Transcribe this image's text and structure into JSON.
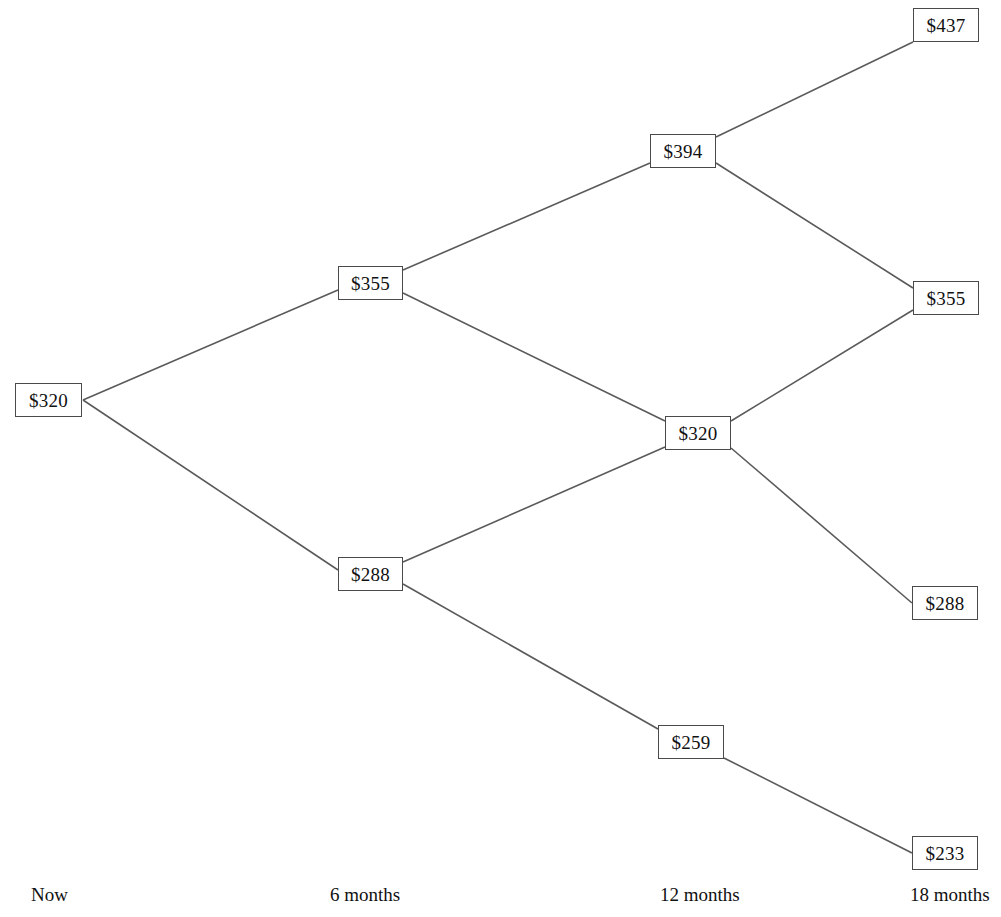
{
  "chart_data": {
    "type": "diagram",
    "diagram_kind": "binomial-lattice",
    "currency_symbol": "$",
    "time_axis": {
      "label": "",
      "ticks": [
        {
          "id": "t0",
          "label": "Now",
          "x": 31,
          "step": 0
        },
        {
          "id": "t1",
          "label": "6 months",
          "x": 330,
          "step": 1
        },
        {
          "id": "t2",
          "label": "12 months",
          "x": 660,
          "step": 2
        },
        {
          "id": "t3",
          "label": "18 months",
          "x": 910,
          "step": 3
        }
      ]
    },
    "nodes": [
      {
        "id": "n0",
        "label": "$320",
        "value": 320,
        "step": 0,
        "x": 15,
        "y": 383,
        "w": 67,
        "h": 34
      },
      {
        "id": "n1u",
        "label": "$355",
        "value": 355,
        "step": 1,
        "x": 338,
        "y": 266,
        "w": 65,
        "h": 34
      },
      {
        "id": "n1d",
        "label": "$288",
        "value": 288,
        "step": 1,
        "x": 338,
        "y": 557,
        "w": 65,
        "h": 34
      },
      {
        "id": "n2uu",
        "label": "$394",
        "value": 394,
        "step": 2,
        "x": 650,
        "y": 134,
        "w": 66,
        "h": 34
      },
      {
        "id": "n2ud",
        "label": "$320",
        "value": 320,
        "step": 2,
        "x": 665,
        "y": 416,
        "w": 66,
        "h": 34
      },
      {
        "id": "n2dd",
        "label": "$259",
        "value": 259,
        "step": 2,
        "x": 658,
        "y": 725,
        "w": 66,
        "h": 34
      },
      {
        "id": "n3uuu",
        "label": "$437",
        "value": 437,
        "step": 3,
        "x": 913,
        "y": 8,
        "w": 66,
        "h": 34
      },
      {
        "id": "n3uud",
        "label": "$355",
        "value": 355,
        "step": 3,
        "x": 913,
        "y": 281,
        "w": 66,
        "h": 34
      },
      {
        "id": "n3udd",
        "label": "$288",
        "value": 288,
        "step": 3,
        "x": 912,
        "y": 586,
        "w": 66,
        "h": 34
      },
      {
        "id": "n3ddd",
        "label": "$233",
        "value": 233,
        "step": 3,
        "x": 912,
        "y": 836,
        "w": 66,
        "h": 34
      }
    ],
    "edges": [
      {
        "from": "n0",
        "to": "n1u",
        "x1": 83,
        "y1": 400,
        "x2": 338,
        "y2": 290
      },
      {
        "from": "n0",
        "to": "n1d",
        "x1": 83,
        "y1": 400,
        "x2": 338,
        "y2": 570
      },
      {
        "from": "n1u",
        "to": "n2uu",
        "x1": 403,
        "y1": 270,
        "x2": 650,
        "y2": 163
      },
      {
        "from": "n1u",
        "to": "n2ud",
        "x1": 403,
        "y1": 293,
        "x2": 665,
        "y2": 421
      },
      {
        "from": "n1d",
        "to": "n2ud",
        "x1": 403,
        "y1": 562,
        "x2": 665,
        "y2": 447
      },
      {
        "from": "n1d",
        "to": "n2dd",
        "x1": 403,
        "y1": 584,
        "x2": 658,
        "y2": 729
      },
      {
        "from": "n2uu",
        "to": "n3uuu",
        "x1": 716,
        "y1": 137,
        "x2": 913,
        "y2": 42
      },
      {
        "from": "n2uu",
        "to": "n3uud",
        "x1": 716,
        "y1": 163,
        "x2": 913,
        "y2": 288
      },
      {
        "from": "n2ud",
        "to": "n3uud",
        "x1": 731,
        "y1": 421,
        "x2": 913,
        "y2": 310
      },
      {
        "from": "n2ud",
        "to": "n3udd",
        "x1": 731,
        "y1": 448,
        "x2": 912,
        "y2": 603
      },
      {
        "from": "n2dd",
        "to": "n3ddd",
        "x1": 724,
        "y1": 758,
        "x2": 912,
        "y2": 853
      }
    ],
    "style": {
      "edge_color": "#5a5a5a",
      "node_border_color": "#4a4a4a",
      "node_fill": "#ffffff",
      "text_color": "#111111",
      "background": "#ffffff"
    }
  }
}
